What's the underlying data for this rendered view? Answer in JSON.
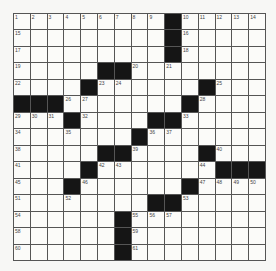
{
  "puzzle": {
    "rows": 15,
    "cols": 15,
    "black_cells": {
      "0": [
        9
      ],
      "1": [
        9
      ],
      "2": [
        9
      ],
      "3": [
        5,
        6
      ],
      "4": [
        4,
        11
      ],
      "5": [
        0,
        1,
        2,
        10
      ],
      "6": [
        3,
        8,
        9
      ],
      "7": [
        7
      ],
      "8": [
        5,
        6,
        11
      ],
      "9": [
        4,
        12,
        13,
        14
      ],
      "10": [
        3,
        10
      ],
      "11": [
        8,
        9
      ],
      "12": [
        6
      ],
      "13": [
        6
      ],
      "14": [
        6
      ]
    },
    "numbers": [
      {
        "r": 0,
        "c": 0,
        "n": "1"
      },
      {
        "r": 0,
        "c": 1,
        "n": "2"
      },
      {
        "r": 0,
        "c": 2,
        "n": "3"
      },
      {
        "r": 0,
        "c": 3,
        "n": "4"
      },
      {
        "r": 0,
        "c": 4,
        "n": "5"
      },
      {
        "r": 0,
        "c": 5,
        "n": "6"
      },
      {
        "r": 0,
        "c": 6,
        "n": "7"
      },
      {
        "r": 0,
        "c": 7,
        "n": "8"
      },
      {
        "r": 0,
        "c": 8,
        "n": "9"
      },
      {
        "r": 0,
        "c": 10,
        "n": "10"
      },
      {
        "r": 0,
        "c": 11,
        "n": "11"
      },
      {
        "r": 0,
        "c": 12,
        "n": "12"
      },
      {
        "r": 0,
        "c": 13,
        "n": "13"
      },
      {
        "r": 0,
        "c": 14,
        "n": "14"
      },
      {
        "r": 1,
        "c": 0,
        "n": "15"
      },
      {
        "r": 1,
        "c": 10,
        "n": "16"
      },
      {
        "r": 2,
        "c": 0,
        "n": "17"
      },
      {
        "r": 2,
        "c": 10,
        "n": "18"
      },
      {
        "r": 3,
        "c": 0,
        "n": "19"
      },
      {
        "r": 3,
        "c": 7,
        "n": "20"
      },
      {
        "r": 3,
        "c": 9,
        "n": "21"
      },
      {
        "r": 4,
        "c": 0,
        "n": "22"
      },
      {
        "r": 4,
        "c": 5,
        "n": "23"
      },
      {
        "r": 4,
        "c": 6,
        "n": "24"
      },
      {
        "r": 4,
        "c": 12,
        "n": "25"
      },
      {
        "r": 5,
        "c": 3,
        "n": "26"
      },
      {
        "r": 5,
        "c": 4,
        "n": "27"
      },
      {
        "r": 5,
        "c": 11,
        "n": "28"
      },
      {
        "r": 6,
        "c": 0,
        "n": "29"
      },
      {
        "r": 6,
        "c": 1,
        "n": "30"
      },
      {
        "r": 6,
        "c": 2,
        "n": "31"
      },
      {
        "r": 6,
        "c": 4,
        "n": "32"
      },
      {
        "r": 6,
        "c": 10,
        "n": "33"
      },
      {
        "r": 7,
        "c": 0,
        "n": "34"
      },
      {
        "r": 7,
        "c": 3,
        "n": "35"
      },
      {
        "r": 7,
        "c": 8,
        "n": "36"
      },
      {
        "r": 7,
        "c": 9,
        "n": "37"
      },
      {
        "r": 8,
        "c": 0,
        "n": "38"
      },
      {
        "r": 8,
        "c": 7,
        "n": "39"
      },
      {
        "r": 8,
        "c": 12,
        "n": "40"
      },
      {
        "r": 9,
        "c": 0,
        "n": "41"
      },
      {
        "r": 9,
        "c": 5,
        "n": "42"
      },
      {
        "r": 9,
        "c": 6,
        "n": "43"
      },
      {
        "r": 9,
        "c": 11,
        "n": "44"
      },
      {
        "r": 10,
        "c": 0,
        "n": "45"
      },
      {
        "r": 10,
        "c": 4,
        "n": "46"
      },
      {
        "r": 10,
        "c": 11,
        "n": "47"
      },
      {
        "r": 10,
        "c": 12,
        "n": "48"
      },
      {
        "r": 10,
        "c": 13,
        "n": "49"
      },
      {
        "r": 10,
        "c": 14,
        "n": "50"
      },
      {
        "r": 11,
        "c": 0,
        "n": "51"
      },
      {
        "r": 11,
        "c": 3,
        "n": "52"
      },
      {
        "r": 11,
        "c": 10,
        "n": "53"
      },
      {
        "r": 12,
        "c": 0,
        "n": "54"
      },
      {
        "r": 12,
        "c": 7,
        "n": "55"
      },
      {
        "r": 12,
        "c": 8,
        "n": "56"
      },
      {
        "r": 12,
        "c": 9,
        "n": "57"
      },
      {
        "r": 13,
        "c": 0,
        "n": "58"
      },
      {
        "r": 13,
        "c": 7,
        "n": "59"
      },
      {
        "r": 14,
        "c": 0,
        "n": "60"
      },
      {
        "r": 14,
        "c": 7,
        "n": "61"
      }
    ]
  }
}
